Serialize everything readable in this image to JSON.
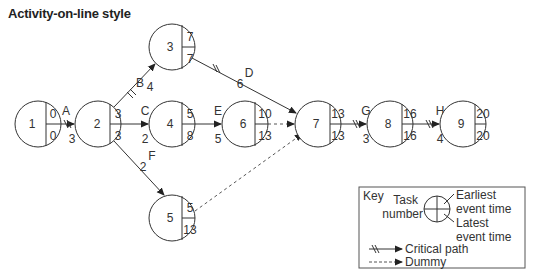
{
  "title": "Activity-on-line style",
  "nodes": [
    {
      "id": "1",
      "earliest": "0",
      "latest": "0",
      "cx": 38,
      "cy": 124
    },
    {
      "id": "2",
      "earliest": "3",
      "latest": "3",
      "cx": 98,
      "cy": 124
    },
    {
      "id": "3",
      "earliest": "7",
      "latest": "7",
      "cx": 172,
      "cy": 47
    },
    {
      "id": "4",
      "earliest": "5",
      "latest": "8",
      "cx": 172,
      "cy": 124
    },
    {
      "id": "5",
      "earliest": "5",
      "latest": "13",
      "cx": 172,
      "cy": 218
    },
    {
      "id": "6",
      "earliest": "10",
      "latest": "13",
      "cx": 245,
      "cy": 124
    },
    {
      "id": "7",
      "earliest": "13",
      "latest": "13",
      "cx": 318,
      "cy": 124
    },
    {
      "id": "8",
      "earliest": "16",
      "latest": "16",
      "cx": 390,
      "cy": 124
    },
    {
      "id": "9",
      "earliest": "20",
      "latest": "20",
      "cx": 463,
      "cy": 124
    }
  ],
  "activities": [
    {
      "name": "A",
      "duration": "3",
      "from": "1",
      "to": "2",
      "critical": true
    },
    {
      "name": "B",
      "duration": "4",
      "from": "2",
      "to": "3",
      "critical": true
    },
    {
      "name": "C",
      "duration": "2",
      "from": "2",
      "to": "4",
      "critical": false
    },
    {
      "name": "D",
      "duration": "6",
      "from": "3",
      "to": "7",
      "critical": true
    },
    {
      "name": "E",
      "duration": "5",
      "from": "4",
      "to": "6",
      "critical": false
    },
    {
      "name": "F",
      "duration": "2",
      "from": "2",
      "to": "5",
      "critical": false
    },
    {
      "name": "G",
      "duration": "3",
      "from": "7",
      "to": "8",
      "critical": true
    },
    {
      "name": "H",
      "duration": "4",
      "from": "8",
      "to": "9",
      "critical": true
    }
  ],
  "dummies": [
    {
      "from": "6",
      "to": "7"
    },
    {
      "from": "5",
      "to": "7"
    }
  ],
  "key": {
    "title": "Key",
    "task_number_line1": "Task",
    "task_number_line2": "number",
    "earliest_line1": "Earliest",
    "earliest_line2": "event time",
    "latest_line1": "Latest",
    "latest_line2": "event time",
    "critical_path": "Critical path",
    "dummy": "Dummy"
  },
  "colors": {
    "line": "#333333",
    "dummy": "#555555",
    "key_border": "#555555"
  }
}
